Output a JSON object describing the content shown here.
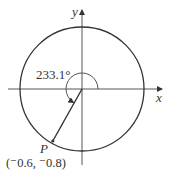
{
  "diagram": {
    "angle_label": "233.1°",
    "x_axis_label": "x",
    "y_axis_label": "y",
    "point_label": "P",
    "point_coords": "(⁻0.6, ⁻0.8)",
    "angle_degrees": 233.1,
    "point": {
      "x": -0.6,
      "y": -0.8
    },
    "colors": {
      "stroke": "#333333"
    }
  }
}
